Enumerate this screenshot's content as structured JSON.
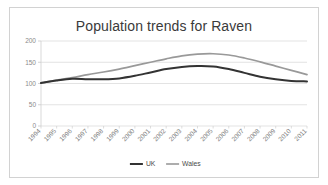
{
  "chart_data": {
    "type": "line",
    "title": "Population trends for Raven",
    "xlabel": "",
    "ylabel": "",
    "ylim": [
      0,
      200
    ],
    "yticks": [
      0,
      50,
      100,
      150,
      200
    ],
    "ytick_labels": [
      "0",
      "50",
      "100",
      "150",
      "200"
    ],
    "grid": true,
    "grid_axis": "y",
    "legend_position": "bottom",
    "categories": [
      "1994",
      "1995",
      "1996",
      "1997",
      "1998",
      "1999",
      "2000",
      "2001",
      "2002",
      "2003",
      "2004",
      "2005",
      "2006",
      "2007",
      "2008",
      "2009",
      "2010",
      "2011"
    ],
    "series": [
      {
        "name": "UK",
        "color": "#333333",
        "width": 2.0,
        "values": [
          101,
          107,
          111,
          110,
          110,
          112,
          118,
          126,
          134,
          139,
          141,
          140,
          134,
          125,
          116,
          110,
          106,
          105
        ]
      },
      {
        "name": "Wales",
        "color": "#999999",
        "width": 1.7,
        "values": [
          101,
          108,
          114,
          121,
          127,
          134,
          142,
          150,
          158,
          165,
          169,
          170,
          167,
          160,
          151,
          141,
          131,
          121
        ]
      }
    ]
  },
  "legend": {
    "items": [
      {
        "label": "UK",
        "color": "#333333"
      },
      {
        "label": "Wales",
        "color": "#999999"
      }
    ]
  },
  "colors": {
    "frame_border": "#d2d2d2",
    "grid": "#dcdcdc",
    "axis_text": "#8a8a8a",
    "title_text": "#3a3a3a",
    "background": "#ffffff"
  }
}
